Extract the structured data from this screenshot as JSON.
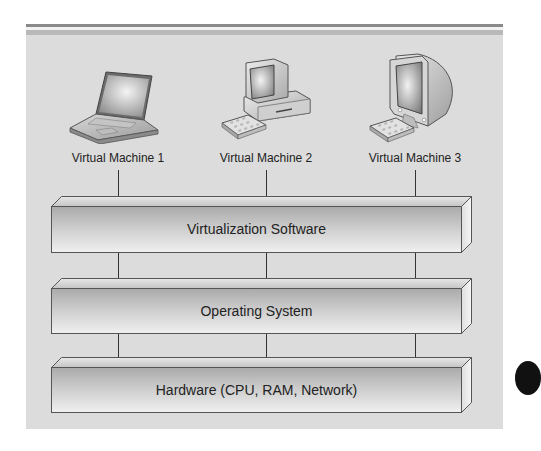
{
  "diagram": {
    "virtual_machines": [
      {
        "label": "Virtual Machine 1",
        "icon": "laptop-icon"
      },
      {
        "label": "Virtual Machine 2",
        "icon": "desktop-computer-icon"
      },
      {
        "label": "Virtual Machine 3",
        "icon": "crt-monitor-icon"
      }
    ],
    "layers": [
      {
        "label": "Virtualization Software"
      },
      {
        "label": "Operating System"
      },
      {
        "label": "Hardware (CPU, RAM, Network)"
      }
    ],
    "colors": {
      "panel_background": "#dcdcdc",
      "top_rule": "#8a8a8a",
      "box_front_light": "#ececec",
      "box_front_dark": "#b8b8b8",
      "box_outline": "#555555",
      "arrow": "#222222",
      "text": "#222222"
    }
  }
}
